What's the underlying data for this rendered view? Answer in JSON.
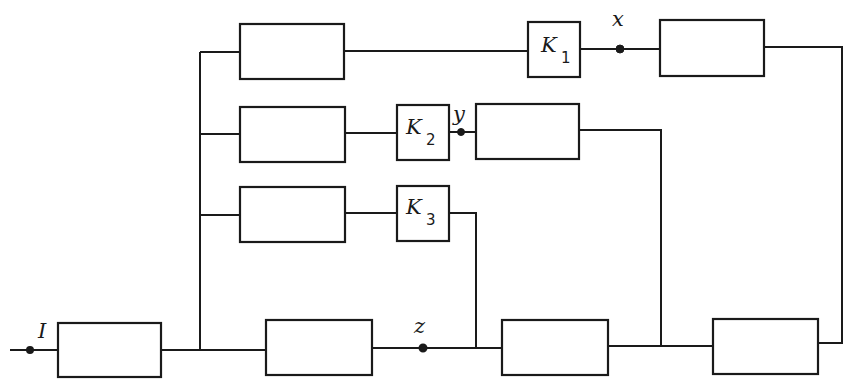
{
  "diagram": {
    "type": "block-diagram",
    "stroke_color": "#1a1a1a",
    "background": "#ffffff",
    "labels": {
      "input": "I",
      "node_x": "x",
      "node_y": "y",
      "node_z": "z",
      "k1_main": "K",
      "k1_sub": "1",
      "k2_main": "K",
      "k2_sub": "2",
      "k3_main": "K",
      "k3_sub": "3"
    },
    "blocks": [
      {
        "id": "input-block",
        "x": 58,
        "y": 323,
        "w": 103,
        "h": 54
      },
      {
        "id": "middle-block",
        "x": 266,
        "y": 320,
        "w": 106,
        "h": 55
      },
      {
        "id": "adder-1",
        "x": 502,
        "y": 320,
        "w": 106,
        "h": 55
      },
      {
        "id": "adder-2",
        "x": 713,
        "y": 319,
        "w": 105,
        "h": 55
      },
      {
        "id": "branch-1-block",
        "x": 240,
        "y": 24,
        "w": 104,
        "h": 55
      },
      {
        "id": "branch-2-block",
        "x": 240,
        "y": 107,
        "w": 105,
        "h": 55
      },
      {
        "id": "branch-3-block",
        "x": 240,
        "y": 187,
        "w": 105,
        "h": 55
      },
      {
        "id": "k1-block",
        "x": 528,
        "y": 22,
        "w": 52,
        "h": 55
      },
      {
        "id": "k2-block",
        "x": 397,
        "y": 105,
        "w": 52,
        "h": 55
      },
      {
        "id": "k3-block",
        "x": 397,
        "y": 186,
        "w": 52,
        "h": 55
      },
      {
        "id": "x-out-block",
        "x": 660,
        "y": 20,
        "w": 104,
        "h": 56
      },
      {
        "id": "y-out-block",
        "x": 476,
        "y": 104,
        "w": 103,
        "h": 55
      }
    ],
    "wires": [
      {
        "id": "input-lead",
        "points": [
          [
            10,
            350
          ],
          [
            58,
            350
          ]
        ]
      },
      {
        "id": "input-to-middle",
        "points": [
          [
            161,
            350
          ],
          [
            266,
            350
          ]
        ]
      },
      {
        "id": "trunk",
        "points": [
          [
            200,
            350
          ],
          [
            200,
            52
          ]
        ]
      },
      {
        "id": "trunk-to-b1",
        "points": [
          [
            200,
            52
          ],
          [
            240,
            52
          ]
        ]
      },
      {
        "id": "trunk-to-b2",
        "points": [
          [
            200,
            134
          ],
          [
            240,
            134
          ]
        ]
      },
      {
        "id": "trunk-to-b3",
        "points": [
          [
            200,
            215
          ],
          [
            240,
            215
          ]
        ]
      },
      {
        "id": "b1-to-k1",
        "points": [
          [
            344,
            51
          ],
          [
            528,
            51
          ]
        ]
      },
      {
        "id": "k1-to-xout",
        "points": [
          [
            580,
            49
          ],
          [
            660,
            49
          ]
        ]
      },
      {
        "id": "xout-feedback",
        "points": [
          [
            764,
            47
          ],
          [
            842,
            47
          ],
          [
            842,
            343
          ],
          [
            818,
            343
          ]
        ]
      },
      {
        "id": "b2-to-k2",
        "points": [
          [
            345,
            133
          ],
          [
            397,
            133
          ]
        ]
      },
      {
        "id": "k2-to-yout",
        "points": [
          [
            449,
            132
          ],
          [
            476,
            132
          ]
        ]
      },
      {
        "id": "yout-feedback",
        "points": [
          [
            579,
            130
          ],
          [
            661,
            130
          ],
          [
            661,
            346
          ]
        ]
      },
      {
        "id": "b3-to-k3",
        "points": [
          [
            345,
            213
          ],
          [
            397,
            213
          ]
        ]
      },
      {
        "id": "k3-feedback",
        "points": [
          [
            449,
            213
          ],
          [
            476,
            213
          ],
          [
            476,
            348
          ]
        ]
      },
      {
        "id": "middle-to-adder1",
        "points": [
          [
            372,
            348
          ],
          [
            502,
            348
          ]
        ]
      },
      {
        "id": "adder1-to-adder2",
        "points": [
          [
            608,
            346
          ],
          [
            713,
            346
          ]
        ]
      }
    ],
    "nodes": [
      {
        "id": "input-terminal",
        "x": 30,
        "y": 350,
        "r": 3,
        "hollow": true
      },
      {
        "id": "node-z",
        "x": 423,
        "y": 348,
        "r": 3.5,
        "hollow": true
      },
      {
        "id": "node-y",
        "x": 461,
        "y": 132,
        "r": 3.5,
        "hollow": false
      },
      {
        "id": "node-x",
        "x": 620,
        "y": 49,
        "r": 4,
        "hollow": false
      }
    ]
  }
}
